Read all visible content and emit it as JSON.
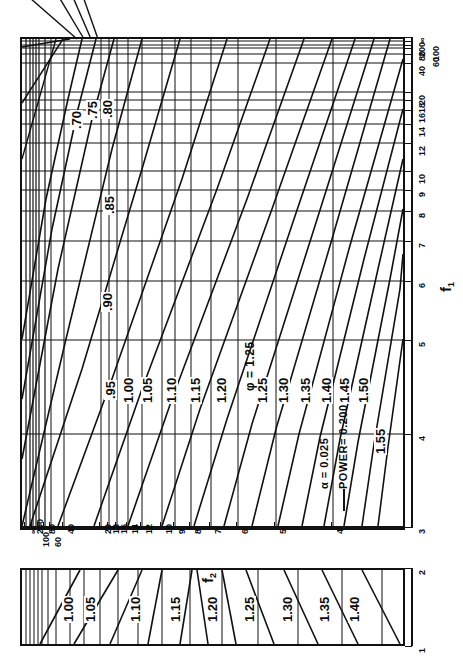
{
  "figure": {
    "kind": "power-chart",
    "background_color": "#ffffff",
    "line_color": "#111111"
  },
  "annotations": {
    "alpha": "α  = 0.025",
    "power": "POWER= 0.200",
    "phi_label": "φ = 1.25"
  },
  "axes": {
    "f1": {
      "name": "f",
      "subscript": "1",
      "ticks": [
        "3",
        "4",
        "5",
        "6",
        "7",
        "8",
        "9",
        "10",
        "12",
        "14",
        "16",
        "18",
        "20",
        "40",
        "60",
        "80",
        "100",
        "200",
        "∞"
      ],
      "main_ticks": [
        "3",
        "4",
        "5",
        "6",
        "7",
        "8",
        "9",
        "10",
        "12",
        "14",
        "16",
        "18",
        "20"
      ],
      "range_main": [
        3,
        20
      ]
    },
    "f2": {
      "name": "f",
      "subscript": "2",
      "ticks_top_row": [
        "∞",
        "200",
        "80",
        "40",
        "20",
        "18",
        "16",
        "14",
        "12",
        "10",
        "9",
        "8",
        "7",
        "6",
        "5",
        "4"
      ],
      "ticks_bottom_row": [
        "100",
        "60"
      ],
      "all_ticks": [
        "∞",
        "200",
        "100",
        "80",
        "60",
        "40",
        "20",
        "18",
        "16",
        "14",
        "12",
        "10",
        "9",
        "8",
        "7",
        "6",
        "5",
        "4"
      ]
    },
    "small_panel": {
      "ticks": [
        "1",
        "2"
      ]
    }
  },
  "chart_data": {
    "type": "line",
    "xlabel": "f₁",
    "ylabel": "f₂",
    "grid": true,
    "legend": "none",
    "alpha": 0.025,
    "power": 0.2,
    "x_axis_main": {
      "label": "f₁",
      "tick_values": [
        3,
        4,
        5,
        6,
        7,
        8,
        9,
        10,
        12,
        14,
        16,
        18,
        20,
        40,
        60,
        80,
        100,
        200,
        null
      ],
      "tick_labels": [
        "3",
        "4",
        "5",
        "6",
        "7",
        "8",
        "9",
        "10",
        "12",
        "14",
        "16",
        "18",
        "20",
        "40",
        "60",
        "80",
        "100",
        "200",
        "∞"
      ],
      "scale": "reciprocal"
    },
    "y_axis_main": {
      "label": "f₂",
      "tick_labels": [
        "∞",
        "200",
        "100",
        "80",
        "60",
        "40",
        "20",
        "18",
        "16",
        "14",
        "12",
        "10",
        "9",
        "8",
        "7",
        "6",
        "5",
        "4"
      ],
      "scale": "reciprocal"
    },
    "x_axis_small": {
      "label": "f₁",
      "tick_labels": [
        "1",
        "2"
      ]
    },
    "series": [
      {
        "name": ".70",
        "phi": 0.7,
        "panel": "main"
      },
      {
        "name": ".75",
        "phi": 0.75,
        "panel": "main"
      },
      {
        "name": ".80",
        "phi": 0.8,
        "panel": "main"
      },
      {
        "name": ".85",
        "phi": 0.85,
        "panel": "main"
      },
      {
        "name": ".90",
        "phi": 0.9,
        "panel": "main"
      },
      {
        "name": ".95",
        "phi": 0.95,
        "panel": "main"
      },
      {
        "name": "1.00",
        "phi": 1.0,
        "panel": "main"
      },
      {
        "name": "1.05",
        "phi": 1.05,
        "panel": "main"
      },
      {
        "name": "1.10",
        "phi": 1.1,
        "panel": "main"
      },
      {
        "name": "1.15",
        "phi": 1.15,
        "panel": "main"
      },
      {
        "name": "1.20",
        "phi": 1.2,
        "panel": "main"
      },
      {
        "name": "1.25",
        "phi": 1.25,
        "panel": "main"
      },
      {
        "name": "1.30",
        "phi": 1.3,
        "panel": "main"
      },
      {
        "name": "1.35",
        "phi": 1.35,
        "panel": "main"
      },
      {
        "name": "1.40",
        "phi": 1.4,
        "panel": "main"
      },
      {
        "name": "1.45",
        "phi": 1.45,
        "panel": "main"
      },
      {
        "name": "1.50",
        "phi": 1.5,
        "panel": "main"
      },
      {
        "name": "1.55",
        "phi": 1.55,
        "panel": "main"
      },
      {
        "name": "1.00",
        "phi": 1.0,
        "panel": "small"
      },
      {
        "name": "1.05",
        "phi": 1.05,
        "panel": "small"
      },
      {
        "name": "1.10",
        "phi": 1.1,
        "panel": "small"
      },
      {
        "name": "1.15",
        "phi": 1.15,
        "panel": "small"
      },
      {
        "name": "1.20",
        "phi": 1.2,
        "panel": "small"
      },
      {
        "name": "1.25",
        "phi": 1.25,
        "panel": "small"
      },
      {
        "name": "1.30",
        "phi": 1.3,
        "panel": "small"
      },
      {
        "name": "1.35",
        "phi": 1.35,
        "panel": "small"
      },
      {
        "name": "1.40",
        "phi": 1.4,
        "panel": "small"
      }
    ],
    "main_curve_labels": [
      ".70",
      ".75",
      ".80",
      ".85",
      ".90",
      ".95",
      "1.00",
      "1.05",
      "1.10",
      "1.15",
      "1.20",
      "1.25",
      "1.30",
      "1.35",
      "1.40",
      "1.45",
      "1.50",
      "1.55"
    ],
    "small_curve_labels": [
      "1.00",
      "1.05",
      "1.10",
      "1.15",
      "1.20",
      "1.25",
      "1.30",
      "1.35",
      "1.40"
    ]
  }
}
